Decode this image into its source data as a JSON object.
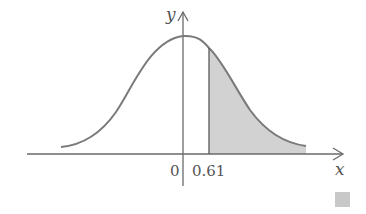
{
  "diagram": {
    "type": "normal-distribution-curve",
    "axes": {
      "x_label": "x",
      "y_label": "y"
    },
    "tick_labels": {
      "origin": "0",
      "shade_start": "0.61"
    },
    "shaded_region": {
      "from": 0.61,
      "to": "right tail",
      "description": "area under curve for x > 0.61"
    },
    "colors": {
      "curve": "#7a7a7a",
      "axis": "#6a6a6a",
      "shade": "#d2d2d2",
      "text": "#555555",
      "corner_square": "#c8c8c8"
    }
  }
}
